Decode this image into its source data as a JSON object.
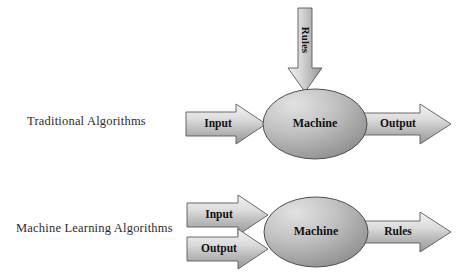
{
  "page": {
    "background_color": "#ffffff"
  },
  "palette": {
    "arrow_fill_light": "#efefef",
    "arrow_fill_mid": "#c9c9c9",
    "arrow_fill_dark": "#9a9a9a",
    "ellipse_fill_light": "#d8d8d8",
    "ellipse_fill_dark": "#8f8f8f",
    "outline": "#555555",
    "text_color": "#121212",
    "label_color": "#2b2b2b"
  },
  "rows": [
    {
      "id": "traditional",
      "label": "Traditional Algorithms",
      "node_label": "Machine",
      "inputs": [
        {
          "id": "input",
          "label": "Input"
        }
      ],
      "outputs": [
        {
          "id": "output",
          "label": "Output"
        }
      ],
      "top_input": {
        "id": "rules",
        "label": "Rules",
        "orientation": "vertical-down"
      }
    },
    {
      "id": "machine-learning",
      "label": "Machine Learning Algorithms",
      "node_label": "Machine",
      "inputs": [
        {
          "id": "input",
          "label": "Input"
        },
        {
          "id": "output",
          "label": "Output"
        }
      ],
      "outputs": [
        {
          "id": "rules",
          "label": "Rules"
        }
      ],
      "top_input": null
    }
  ]
}
